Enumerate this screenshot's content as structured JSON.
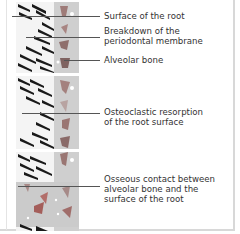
{
  "figure": {
    "type": "histology-schematic",
    "panels": [
      {
        "id": "top",
        "description": "Intact periodontal ligament fibers between root and alveolar bone"
      },
      {
        "id": "middle",
        "description": "Osteoclastic resorption of root surface"
      },
      {
        "id": "bottom",
        "description": "Bone directly contacting root surface"
      }
    ],
    "labels": [
      {
        "id": "surface-root",
        "text": "Surface of the root"
      },
      {
        "id": "breakdown-pdl",
        "text": "Breakdown of the\nperiodontal membrane"
      },
      {
        "id": "alveolar-bone",
        "text": "Alveolar bone"
      },
      {
        "id": "osteoclastic",
        "text": "Osteoclastic resorption\nof the root surface"
      },
      {
        "id": "osseous-contact",
        "text": "Osseous contact between\nalveolar bone and the\nsurface of the root"
      }
    ],
    "colors": {
      "fiber": "#1a1a1a",
      "tissue_gray": "#c9c9c9",
      "cell_red": "#b0706a",
      "cell_dark": "#8a5c58",
      "leader_line": "#555555",
      "text": "#333333",
      "border": "#d8d8d8"
    }
  }
}
